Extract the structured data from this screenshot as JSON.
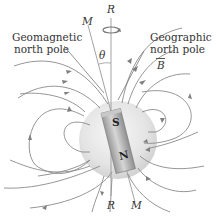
{
  "diagram": {
    "labels": {
      "geomagnetic_line1": "Geomagnetic",
      "geomagnetic_line2": "north pole",
      "geographic_line1": "Geographic",
      "geographic_line2": "north pole",
      "field": "B",
      "rotation_axis_top": "R",
      "rotation_axis_bottom": "R",
      "magnetic_axis_top": "M",
      "magnetic_axis_bottom": "M",
      "angle": "θ",
      "magnet_top_pole": "S",
      "magnet_bottom_pole": "N"
    },
    "colors": {
      "field_lines": "#8a8a8a",
      "globe": "#e6e6e6",
      "magnet": "#b9b9b9",
      "text": "#333333"
    }
  }
}
